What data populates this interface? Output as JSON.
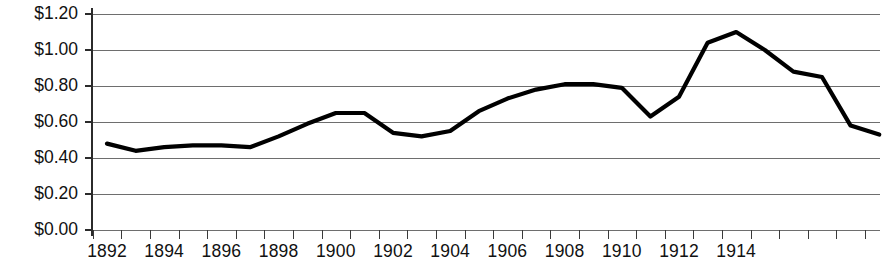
{
  "chart_data": {
    "type": "line",
    "title": "",
    "subtitle": "",
    "xlabel": "",
    "ylabel": "",
    "x": [
      1892,
      1893,
      1894,
      1895,
      1896,
      1897,
      1898,
      1899,
      1900,
      1901,
      1902,
      1903,
      1904,
      1905,
      1906,
      1907,
      1908,
      1909,
      1910,
      1911,
      1912,
      1913,
      1914,
      1915
    ],
    "values": [
      0.48,
      0.44,
      0.46,
      0.47,
      0.47,
      0.46,
      0.52,
      0.59,
      0.65,
      0.65,
      0.54,
      0.52,
      0.55,
      0.66,
      0.73,
      0.78,
      0.81,
      0.81,
      0.79,
      0.63,
      0.74,
      1.04,
      1.1,
      1.0
    ],
    "series": [
      {
        "name": "Price",
        "values": [
          0.48,
          0.44,
          0.46,
          0.47,
          0.47,
          0.46,
          0.52,
          0.59,
          0.65,
          0.65,
          0.54,
          0.52,
          0.55,
          0.66,
          0.73,
          0.78,
          0.81,
          0.81,
          0.79,
          0.63,
          0.74,
          1.04,
          1.1,
          1.0
        ],
        "color": "#000000"
      }
    ],
    "points": [
      {
        "x": 1892,
        "y": 0.48
      },
      {
        "x": 1893,
        "y": 0.44
      },
      {
        "x": 1894,
        "y": 0.46
      },
      {
        "x": 1895,
        "y": 0.47
      },
      {
        "x": 1896,
        "y": 0.47
      },
      {
        "x": 1897,
        "y": 0.46
      },
      {
        "x": 1898,
        "y": 0.52
      },
      {
        "x": 1899,
        "y": 0.59
      },
      {
        "x": 1900,
        "y": 0.65
      },
      {
        "x": 1901,
        "y": 0.65
      },
      {
        "x": 1902,
        "y": 0.54
      },
      {
        "x": 1903,
        "y": 0.52
      },
      {
        "x": 1904,
        "y": 0.55
      },
      {
        "x": 1905,
        "y": 0.66
      },
      {
        "x": 1906,
        "y": 0.73
      },
      {
        "x": 1907,
        "y": 0.78
      },
      {
        "x": 1908,
        "y": 0.81
      },
      {
        "x": 1909,
        "y": 0.81
      },
      {
        "x": 1910,
        "y": 0.79
      },
      {
        "x": 1911,
        "y": 0.63
      },
      {
        "x": 1912,
        "y": 0.74
      },
      {
        "x": 1913,
        "y": 1.04
      },
      {
        "x": 1914,
        "y": 1.1
      },
      {
        "x": 1915,
        "y": 1.0
      },
      {
        "x": 1916,
        "y": 0.88
      },
      {
        "x": 1917,
        "y": 0.85
      },
      {
        "x": 1918,
        "y": 0.58
      },
      {
        "x": 1919,
        "y": 0.53
      }
    ],
    "ylim": [
      0.0,
      1.2
    ],
    "ytick_values": [
      0.0,
      0.2,
      0.4,
      0.6,
      0.8,
      1.0,
      1.2
    ],
    "ytick_labels": [
      "$0.00",
      "$0.20",
      "$0.40",
      "$0.60",
      "$0.80",
      "$1.00",
      "$1.20"
    ],
    "xtick_labels": [
      "1892",
      "1894",
      "1896",
      "1898",
      "1900",
      "1902",
      "1904",
      "1906",
      "1908",
      "1910",
      "1912",
      "1914"
    ],
    "xtick_label_years": [
      1892,
      1894,
      1896,
      1898,
      1900,
      1902,
      1904,
      1906,
      1908,
      1910,
      1912,
      1914
    ],
    "xlim": [
      1892,
      1919
    ],
    "grid": "horizontal",
    "legend": "none",
    "line_color": "#000000",
    "gridline_color": "#6e6e6e",
    "axis_color": "#2b2b2b",
    "background": "#ffffff"
  }
}
